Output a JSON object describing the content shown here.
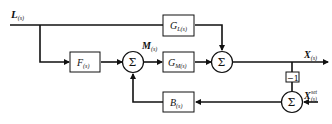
{
  "diagram": {
    "type": "feedforward-feedback control block diagram",
    "signals": {
      "load": {
        "main": "L",
        "sub": "(s)"
      },
      "manipulated": {
        "main": "M",
        "sub": "(s)"
      },
      "output": {
        "main": "X",
        "sub": "(s)"
      },
      "setpoint": {
        "main": "X",
        "sub": "(s)",
        "sup": "set"
      }
    },
    "blocks": {
      "gl": {
        "main": "G",
        "sub": "L(s)"
      },
      "f": {
        "main": "F",
        "sub": "(s)"
      },
      "gm": {
        "main": "G",
        "sub": "M(s)"
      },
      "b": {
        "main": "B",
        "sub": "(s)"
      },
      "neg": {
        "label": "−1"
      }
    },
    "summers": {
      "sum1": {
        "symbol": "Σ"
      },
      "sum2": {
        "symbol": "Σ"
      },
      "sum3": {
        "symbol": "Σ"
      }
    }
  }
}
